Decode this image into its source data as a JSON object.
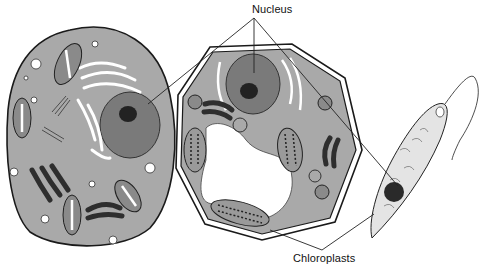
{
  "diagram": {
    "type": "cell comparison illustration",
    "panels": [
      {
        "id": "animal-cell",
        "shape": "oval"
      },
      {
        "id": "plant-cell",
        "shape": "octagon"
      },
      {
        "id": "euglena-cell",
        "shape": "spindle with flagellum"
      }
    ],
    "labels": {
      "nucleus": "Nucleus",
      "chloroplasts": "Chloroplasts"
    },
    "colors": {
      "cytoplasm": "#a9a9a9",
      "nucleus": "#7a7a7a",
      "nucleolus": "#222222",
      "outline": "#1a1a1a",
      "background": "#ffffff",
      "organelle_dark": "#2e2e2e"
    }
  }
}
